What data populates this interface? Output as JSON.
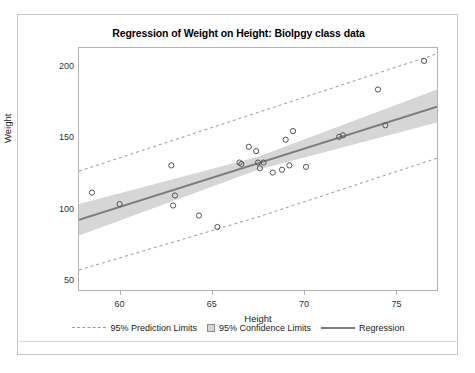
{
  "chart_data": {
    "type": "scatter",
    "title": "Regression of Weight on Height: Biolpgy class data",
    "xlabel": "Height",
    "ylabel": "Weight",
    "xlim": [
      57.8,
      77.2
    ],
    "ylim": [
      44,
      213
    ],
    "xticks": [
      60,
      65,
      70,
      75
    ],
    "yticks": [
      50,
      100,
      150,
      200
    ],
    "grid": false,
    "legend_position": "bottom",
    "points": [
      {
        "x": 58.5,
        "y": 112
      },
      {
        "x": 60.0,
        "y": 104
      },
      {
        "x": 62.8,
        "y": 131
      },
      {
        "x": 62.9,
        "y": 103
      },
      {
        "x": 63.0,
        "y": 110
      },
      {
        "x": 64.3,
        "y": 96
      },
      {
        "x": 65.3,
        "y": 88
      },
      {
        "x": 66.5,
        "y": 133
      },
      {
        "x": 66.6,
        "y": 132
      },
      {
        "x": 67.0,
        "y": 144
      },
      {
        "x": 67.4,
        "y": 141
      },
      {
        "x": 67.5,
        "y": 133
      },
      {
        "x": 67.6,
        "y": 129
      },
      {
        "x": 67.8,
        "y": 133
      },
      {
        "x": 68.3,
        "y": 126
      },
      {
        "x": 68.8,
        "y": 128
      },
      {
        "x": 69.0,
        "y": 149
      },
      {
        "x": 69.2,
        "y": 131
      },
      {
        "x": 69.4,
        "y": 155
      },
      {
        "x": 70.1,
        "y": 130
      },
      {
        "x": 71.9,
        "y": 151
      },
      {
        "x": 72.1,
        "y": 152
      },
      {
        "x": 74.0,
        "y": 184
      },
      {
        "x": 74.4,
        "y": 159
      },
      {
        "x": 76.5,
        "y": 204
      }
    ],
    "regression": {
      "label": "Regression",
      "color": "#7d7d7d",
      "x_start": 57.8,
      "y_start": 93,
      "x_end": 77.2,
      "y_end": 172
    },
    "confidence_band": {
      "label": "95% Confidence Limits",
      "color": "#d6d6d6",
      "lower": [
        {
          "x": 57.8,
          "y": 82
        },
        {
          "x": 67.5,
          "y": 128
        },
        {
          "x": 77.2,
          "y": 161
        }
      ],
      "upper": [
        {
          "x": 57.8,
          "y": 104
        },
        {
          "x": 67.5,
          "y": 137
        },
        {
          "x": 77.2,
          "y": 184
        }
      ]
    },
    "prediction_limits": {
      "label": "95% Prediction Limits",
      "color": "#9a9a9a",
      "lower": [
        {
          "x": 57.8,
          "y": 58
        },
        {
          "x": 67.5,
          "y": 95
        },
        {
          "x": 77.2,
          "y": 136
        }
      ],
      "upper": [
        {
          "x": 57.8,
          "y": 127
        },
        {
          "x": 67.5,
          "y": 168
        },
        {
          "x": 77.2,
          "y": 209
        }
      ]
    }
  },
  "legend": {
    "items": [
      {
        "label": "95% Prediction Limits",
        "marker": "dashed-line"
      },
      {
        "label": "95% Confidence Limits",
        "marker": "shaded-box"
      },
      {
        "label": "Regression",
        "marker": "solid-line"
      }
    ]
  }
}
